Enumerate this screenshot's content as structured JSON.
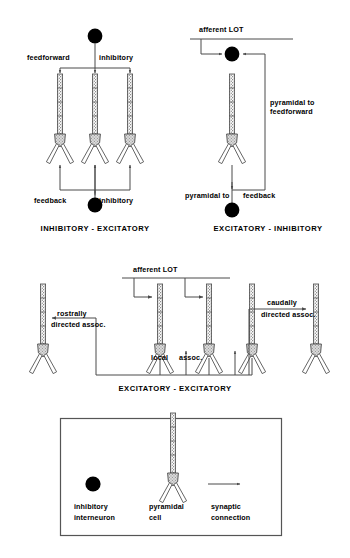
{
  "figure": {
    "colors": {
      "ink": "#1a1a1a",
      "line": "#4a4a4a",
      "soma_fill": "#d9d9d9",
      "apical_fill": "#c9c9c9",
      "dendrite_fill": "#ffffff",
      "interneuron": "#000000",
      "box_border": "#555555"
    }
  },
  "panels": {
    "inhibitory_excitatory": {
      "caption": "INHIBITORY - EXCITATORY",
      "labels": {
        "top_left": "feedforward",
        "top_right": "inhibitory",
        "bottom_left": "feedback",
        "bottom_right": "inhibitory"
      },
      "neuron_count": 3,
      "interneuron_count": 2
    },
    "excitatory_inhibitory": {
      "caption": "EXCITATORY - INHIBITORY",
      "labels": {
        "afferent": "afferent  LOT",
        "right_line1": "pyramidal to",
        "right_line2": "feedforward",
        "bottom_left": "pyramidal to",
        "bottom_right": "feedback"
      },
      "neuron_count": 1,
      "interneuron_count": 2
    },
    "excitatory_excitatory": {
      "caption": "EXCITATORY - EXCITATORY",
      "labels": {
        "afferent": "afferent  LOT",
        "rostrally_line1": "rostrally",
        "rostrally_line2": "directed  assoc.",
        "local_line1": "local",
        "local_line2": "assoc.",
        "caudally_line1": "caudally",
        "caudally_line2": "directed  assoc."
      },
      "neuron_count": 5
    }
  },
  "legend": {
    "items": [
      {
        "symbol": "filled-circle",
        "line1": "inhibitory",
        "line2": "interneuron"
      },
      {
        "symbol": "pyramidal-neuron",
        "line1": "pyramidal",
        "line2": "cell"
      },
      {
        "symbol": "arrow",
        "line1": "synaptic",
        "line2": "connection"
      }
    ]
  }
}
